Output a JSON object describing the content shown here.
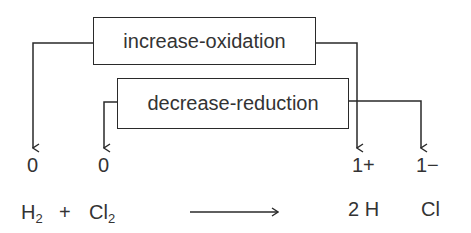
{
  "diagram": {
    "type": "redox-oxidation-state-diagram",
    "boxes": {
      "oxidation": {
        "label": "increase-oxidation"
      },
      "reduction": {
        "label": "decrease-reduction"
      }
    },
    "oxidation_states": {
      "h2": "0",
      "cl2": "0",
      "h_product": "1+",
      "cl_product": "1−"
    },
    "equation": {
      "reactant1_symbol": "H",
      "reactant1_subscript": "2",
      "plus": "+",
      "reactant2_symbol": "Cl",
      "reactant2_subscript": "2",
      "product1": "2 H",
      "product2": "Cl"
    },
    "colors": {
      "line": "#2a2a2a",
      "text": "#333333",
      "background": "#ffffff"
    }
  }
}
